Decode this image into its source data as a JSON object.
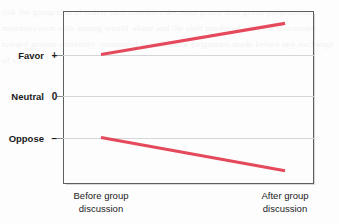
{
  "chart_data": {
    "type": "line",
    "title": "",
    "xlabel": "",
    "ylabel": "",
    "grid": true,
    "legend": "none",
    "x_categories": [
      "Before group discussion",
      "After group discussion"
    ],
    "y_tick_labels": [
      {
        "name": "Favor",
        "symbol": "+",
        "value": 1
      },
      {
        "name": "Neutral",
        "symbol": "0",
        "value": 0
      },
      {
        "name": "Oppose",
        "symbol": "−",
        "value": -1
      }
    ],
    "ylim": [
      -2,
      2
    ],
    "series": [
      {
        "name": "Initially favoring group",
        "color": "#e4495c",
        "x": [
          "Before group discussion",
          "After group discussion"
        ],
        "values": [
          1.0,
          1.75
        ]
      },
      {
        "name": "Initially opposing group",
        "color": "#e4495c",
        "x": [
          "Before group discussion",
          "After group discussion"
        ],
        "values": [
          -1.0,
          -1.8
        ]
      }
    ],
    "annotations": []
  },
  "axes": {
    "y": {
      "favor": {
        "label": "Favor",
        "symbol": "+"
      },
      "neutral": {
        "label": "Neutral",
        "symbol": "0"
      },
      "oppose": {
        "label": "Oppose",
        "symbol": "−"
      }
    },
    "x": {
      "before": {
        "line1": "Before group",
        "line2": "discussion"
      },
      "after": {
        "line1": "After group",
        "line2": "discussion"
      }
    }
  },
  "style": {
    "line_color": "#e4495c",
    "frame_color": "#5d5f61",
    "gridline_color": "#d5d6d7",
    "text_color": "#1b1b1b",
    "background": "#fdfdfd"
  },
  "bleed_text": "risk the group that of indivi each members decision group than group polarization members own with among would  alone and the shift produced after the discussion toward greater extremity  compared to individual judgments made before any exchange of views"
}
